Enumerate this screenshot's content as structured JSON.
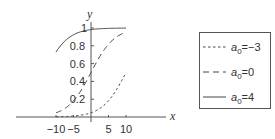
{
  "chart_data": {
    "type": "line",
    "title": "",
    "xlabel": "x",
    "ylabel": "y",
    "xlim": [
      -10,
      10
    ],
    "ylim": [
      0,
      1
    ],
    "x_ticks": [
      -10,
      -5,
      5,
      10
    ],
    "y_ticks": [
      0.2,
      0.4,
      0.6,
      0.8,
      1
    ],
    "x_tick_labels": [
      "−10",
      "−5",
      "5",
      "10"
    ],
    "y_tick_labels": [
      "0.2",
      "0.4",
      "0.6",
      "0.8",
      "1"
    ],
    "grid": false,
    "legend_position": "right",
    "function": "y = 1 / (1 + exp(-(a0 + 0.3 x)))",
    "x": [
      -10,
      -8,
      -6,
      -4,
      -2,
      0,
      2,
      4,
      6,
      8,
      10
    ],
    "series": [
      {
        "name": "a0=-3",
        "a0": -3,
        "style": "dotted",
        "values": [
          0.002,
          0.005,
          0.008,
          0.015,
          0.027,
          0.047,
          0.083,
          0.142,
          0.231,
          0.354,
          0.5
        ]
      },
      {
        "name": "a0=0",
        "a0": 0,
        "style": "dashed",
        "values": [
          0.047,
          0.083,
          0.142,
          0.231,
          0.354,
          0.5,
          0.646,
          0.769,
          0.858,
          0.917,
          0.953
        ]
      },
      {
        "name": "a0=4",
        "a0": 4,
        "style": "solid",
        "values": [
          0.731,
          0.832,
          0.9,
          0.943,
          0.968,
          0.982,
          0.99,
          0.995,
          0.997,
          0.998,
          0.999
        ]
      }
    ]
  },
  "legend": {
    "items": [
      {
        "base": "a",
        "sub": "0",
        "rest": "=−3",
        "style": "dotted"
      },
      {
        "base": "a",
        "sub": "0",
        "rest": "=0",
        "style": "dashed"
      },
      {
        "base": "a",
        "sub": "0",
        "rest": "=4",
        "style": "solid"
      }
    ]
  },
  "colors": {
    "line": "#444444",
    "axis": "#555555",
    "text": "#333333"
  }
}
